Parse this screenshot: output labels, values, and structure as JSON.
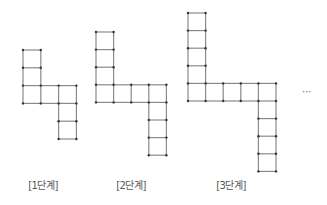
{
  "diagram": {
    "type": "matchstick-square-pattern",
    "stages": [
      {
        "label": "[1단계]",
        "vertical_arm_squares": 3,
        "horizontal_arm_squares": 3,
        "descending_arm_squares": 2,
        "total_squares": 7
      },
      {
        "label": "[2단계]",
        "vertical_arm_squares": 4,
        "horizontal_arm_squares": 4,
        "descending_arm_squares": 3,
        "total_squares": 10
      },
      {
        "label": "[3단계]",
        "vertical_arm_squares": 5,
        "horizontal_arm_squares": 5,
        "descending_arm_squares": 4,
        "total_squares": 13
      }
    ],
    "continuation": "···",
    "colors": {
      "line": "#8a8a8a",
      "dot": "#333333",
      "label": "#555555"
    }
  }
}
